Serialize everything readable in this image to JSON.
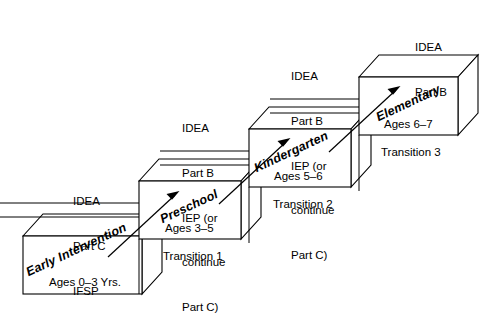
{
  "diagram": {
    "stages": [
      {
        "id": "early-intervention",
        "name": "Early Intervention",
        "ages": "Ages 0–3 Yrs.",
        "note": "IDEA\nPart C\nIFSP",
        "note_lines": [
          "IDEA",
          "Part C",
          "IFSP"
        ]
      },
      {
        "id": "preschool",
        "name": "Preschool",
        "ages": "Ages 3–5",
        "note": "IDEA\nPart B\nIEP (or\ncontinue\nPart C)",
        "note_lines": [
          "IDEA",
          "Part B",
          "IEP (or",
          "continue",
          "Part C)"
        ]
      },
      {
        "id": "kindergarten",
        "name": "Kindergarten",
        "ages": "Ages 5–6",
        "note": "IDEA\nPart B\nIEP (or\ncontinue\nPart C)",
        "note_lines": [
          "IDEA",
          "Part B",
          "IEP (or",
          "continue",
          "Part C)"
        ]
      },
      {
        "id": "elementary",
        "name": "Elementary",
        "ages": "Ages 6–7",
        "note": "IDEA\nPart B",
        "note_lines": [
          "IDEA",
          "Part B"
        ]
      }
    ],
    "transitions": [
      {
        "id": "transition-1",
        "label": "Transition 1"
      },
      {
        "id": "transition-2",
        "label": "Transition 2"
      },
      {
        "id": "transition-3",
        "label": "Transition 3"
      }
    ],
    "colors": {
      "stroke": "#000000",
      "fill": "#ffffff",
      "text": "#000000"
    }
  }
}
